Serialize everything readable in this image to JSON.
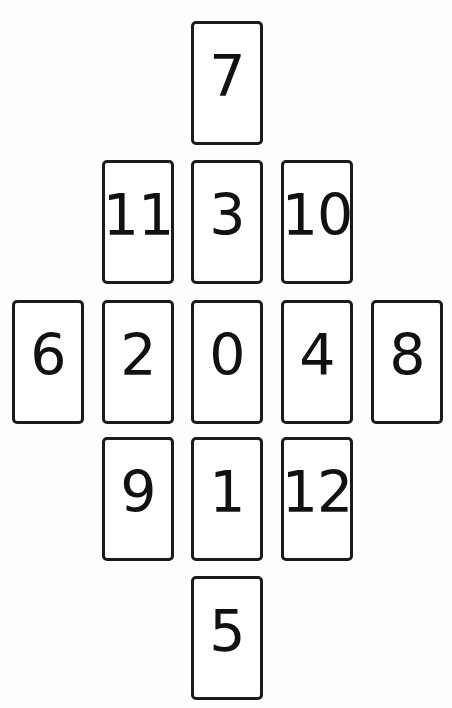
{
  "figure": {
    "kind": "card-grid-diagram",
    "shape": "diamond",
    "background_color": "#fdfdfd",
    "card_border_color": "#1b1b1b",
    "card_fill_color": "#ffffff",
    "label_color": "#111111",
    "columns": 5,
    "rows": 5,
    "card_width_px": 72,
    "card_height_px": 124
  },
  "cards": [
    {
      "label": "7",
      "row": 1,
      "col": 3
    },
    {
      "label": "11",
      "row": 2,
      "col": 2
    },
    {
      "label": "3",
      "row": 2,
      "col": 3
    },
    {
      "label": "10",
      "row": 2,
      "col": 4
    },
    {
      "label": "6",
      "row": 3,
      "col": 1
    },
    {
      "label": "2",
      "row": 3,
      "col": 2
    },
    {
      "label": "0",
      "row": 3,
      "col": 3
    },
    {
      "label": "4",
      "row": 3,
      "col": 4
    },
    {
      "label": "8",
      "row": 3,
      "col": 5
    },
    {
      "label": "9",
      "row": 4,
      "col": 2
    },
    {
      "label": "1",
      "row": 4,
      "col": 3
    },
    {
      "label": "12",
      "row": 4,
      "col": 4
    },
    {
      "label": "5",
      "row": 5,
      "col": 3
    }
  ]
}
